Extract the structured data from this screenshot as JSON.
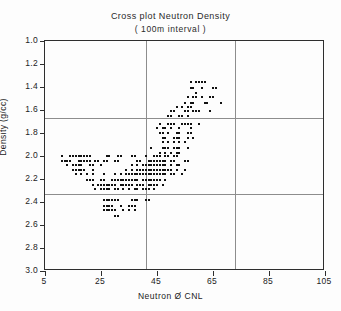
{
  "chart_data": {
    "type": "scatter",
    "title": "Cross plot Neutron Density",
    "subtitle": "( 100m interval )",
    "xlabel": "Neutron Ø CNL",
    "ylabel": "Density (g/cc)",
    "xlim": [
      5,
      105
    ],
    "ylim": [
      3.0,
      1.0
    ],
    "y_inverted": true,
    "xticks": [
      5,
      25,
      45,
      65,
      85,
      105
    ],
    "yticks": [
      1.0,
      1.2,
      1.4,
      1.6,
      1.8,
      2.0,
      2.2,
      2.4,
      2.6,
      2.8,
      3.0
    ],
    "xtick_labels": [
      "5",
      "25",
      "45",
      "65",
      "85",
      "105"
    ],
    "ytick_labels": [
      "1.0",
      "1.2",
      "1.4",
      "1.6",
      "1.8",
      "2.0",
      "2.2",
      "2.4",
      "2.6",
      "2.8",
      "3.0"
    ],
    "grid": true,
    "gridlines_h": [
      1.67,
      2.33
    ],
    "gridlines_v": [
      41,
      73
    ],
    "legend": null,
    "marker": "square",
    "marker_color": "#111111",
    "marker_size_px": 2,
    "series": [
      {
        "name": "Neutron-Density points",
        "points": [
          [
            57,
            1.36
          ],
          [
            59,
            1.36
          ],
          [
            60,
            1.36
          ],
          [
            61,
            1.36
          ],
          [
            62,
            1.36
          ],
          [
            57,
            1.41
          ],
          [
            58,
            1.41
          ],
          [
            61,
            1.41
          ],
          [
            65,
            1.41
          ],
          [
            66,
            1.41
          ],
          [
            59,
            1.45
          ],
          [
            56,
            1.49
          ],
          [
            58,
            1.49
          ],
          [
            59,
            1.49
          ],
          [
            61,
            1.49
          ],
          [
            64,
            1.49
          ],
          [
            65,
            1.49
          ],
          [
            55,
            1.54
          ],
          [
            57,
            1.54
          ],
          [
            58,
            1.54
          ],
          [
            62,
            1.54
          ],
          [
            63,
            1.54
          ],
          [
            68,
            1.54
          ],
          [
            52,
            1.57
          ],
          [
            54,
            1.57
          ],
          [
            56,
            1.57
          ],
          [
            57,
            1.57
          ],
          [
            50,
            1.61
          ],
          [
            51,
            1.61
          ],
          [
            55,
            1.61
          ],
          [
            56,
            1.61
          ],
          [
            58,
            1.61
          ],
          [
            59,
            1.61
          ],
          [
            60,
            1.61
          ],
          [
            64,
            1.61
          ],
          [
            49,
            1.65
          ],
          [
            50,
            1.65
          ],
          [
            53,
            1.65
          ],
          [
            54,
            1.65
          ],
          [
            56,
            1.65
          ],
          [
            46,
            1.72
          ],
          [
            49,
            1.72
          ],
          [
            50,
            1.72
          ],
          [
            51,
            1.72
          ],
          [
            54,
            1.72
          ],
          [
            55,
            1.72
          ],
          [
            56,
            1.72
          ],
          [
            57,
            1.72
          ],
          [
            60,
            1.72
          ],
          [
            45,
            1.76
          ],
          [
            47,
            1.76
          ],
          [
            48,
            1.76
          ],
          [
            50,
            1.76
          ],
          [
            53,
            1.76
          ],
          [
            57,
            1.76
          ],
          [
            46,
            1.8
          ],
          [
            47,
            1.8
          ],
          [
            49,
            1.8
          ],
          [
            52,
            1.8
          ],
          [
            53,
            1.8
          ],
          [
            56,
            1.8
          ],
          [
            57,
            1.8
          ],
          [
            47,
            1.84
          ],
          [
            48,
            1.84
          ],
          [
            51,
            1.84
          ],
          [
            52,
            1.84
          ],
          [
            53,
            1.84
          ],
          [
            56,
            1.84
          ],
          [
            58,
            1.84
          ],
          [
            47,
            1.88
          ],
          [
            49,
            1.88
          ],
          [
            51,
            1.88
          ],
          [
            53,
            1.88
          ],
          [
            55,
            1.88
          ],
          [
            43,
            1.93
          ],
          [
            47,
            1.93
          ],
          [
            48,
            1.93
          ],
          [
            49,
            1.93
          ],
          [
            51,
            1.93
          ],
          [
            52,
            1.93
          ],
          [
            53,
            1.93
          ],
          [
            56,
            1.93
          ],
          [
            46,
            1.97
          ],
          [
            48,
            1.97
          ],
          [
            50,
            1.97
          ],
          [
            52,
            1.97
          ],
          [
            53,
            1.97
          ],
          [
            11,
            2.0
          ],
          [
            14,
            2.0
          ],
          [
            15,
            2.0
          ],
          [
            16,
            2.0
          ],
          [
            17,
            2.0
          ],
          [
            18,
            2.0
          ],
          [
            19,
            2.0
          ],
          [
            20,
            2.0
          ],
          [
            21,
            2.0
          ],
          [
            27,
            2.0
          ],
          [
            28,
            2.0
          ],
          [
            31,
            2.0
          ],
          [
            32,
            2.0
          ],
          [
            36,
            2.0
          ],
          [
            37,
            2.0
          ],
          [
            41,
            2.0
          ],
          [
            44,
            2.0
          ],
          [
            45,
            2.0
          ],
          [
            46,
            2.0
          ],
          [
            48,
            2.0
          ],
          [
            49,
            2.0
          ],
          [
            51,
            2.0
          ],
          [
            52,
            2.0
          ],
          [
            11,
            2.04
          ],
          [
            12,
            2.04
          ],
          [
            13,
            2.04
          ],
          [
            14,
            2.04
          ],
          [
            17,
            2.04
          ],
          [
            18,
            2.04
          ],
          [
            19,
            2.04
          ],
          [
            20,
            2.04
          ],
          [
            21,
            2.04
          ],
          [
            23,
            2.04
          ],
          [
            24,
            2.04
          ],
          [
            26,
            2.04
          ],
          [
            27,
            2.04
          ],
          [
            30,
            2.04
          ],
          [
            31,
            2.04
          ],
          [
            38,
            2.04
          ],
          [
            39,
            2.04
          ],
          [
            42,
            2.04
          ],
          [
            43,
            2.04
          ],
          [
            44,
            2.04
          ],
          [
            45,
            2.04
          ],
          [
            46,
            2.04
          ],
          [
            47,
            2.04
          ],
          [
            48,
            2.04
          ],
          [
            50,
            2.04
          ],
          [
            51,
            2.04
          ],
          [
            55,
            2.04
          ],
          [
            56,
            2.04
          ],
          [
            13,
            2.08
          ],
          [
            15,
            2.08
          ],
          [
            16,
            2.08
          ],
          [
            17,
            2.08
          ],
          [
            18,
            2.08
          ],
          [
            21,
            2.08
          ],
          [
            22,
            2.08
          ],
          [
            25,
            2.08
          ],
          [
            36,
            2.08
          ],
          [
            38,
            2.08
          ],
          [
            40,
            2.08
          ],
          [
            41,
            2.08
          ],
          [
            42,
            2.08
          ],
          [
            43,
            2.08
          ],
          [
            44,
            2.08
          ],
          [
            45,
            2.08
          ],
          [
            46,
            2.08
          ],
          [
            47,
            2.08
          ],
          [
            48,
            2.08
          ],
          [
            50,
            2.08
          ],
          [
            52,
            2.08
          ],
          [
            53,
            2.08
          ],
          [
            15,
            2.12
          ],
          [
            16,
            2.12
          ],
          [
            17,
            2.12
          ],
          [
            18,
            2.12
          ],
          [
            19,
            2.12
          ],
          [
            22,
            2.12
          ],
          [
            34,
            2.12
          ],
          [
            36,
            2.12
          ],
          [
            38,
            2.12
          ],
          [
            39,
            2.12
          ],
          [
            40,
            2.12
          ],
          [
            41,
            2.12
          ],
          [
            42,
            2.12
          ],
          [
            43,
            2.12
          ],
          [
            44,
            2.12
          ],
          [
            45,
            2.12
          ],
          [
            46,
            2.12
          ],
          [
            47,
            2.12
          ],
          [
            48,
            2.12
          ],
          [
            49,
            2.12
          ],
          [
            50,
            2.12
          ],
          [
            52,
            2.12
          ],
          [
            55,
            2.12
          ],
          [
            16,
            2.16
          ],
          [
            18,
            2.16
          ],
          [
            20,
            2.16
          ],
          [
            22,
            2.16
          ],
          [
            26,
            2.16
          ],
          [
            30,
            2.16
          ],
          [
            32,
            2.16
          ],
          [
            34,
            2.16
          ],
          [
            35,
            2.16
          ],
          [
            36,
            2.16
          ],
          [
            37,
            2.16
          ],
          [
            38,
            2.16
          ],
          [
            39,
            2.16
          ],
          [
            40,
            2.16
          ],
          [
            41,
            2.16
          ],
          [
            42,
            2.16
          ],
          [
            43,
            2.16
          ],
          [
            44,
            2.16
          ],
          [
            45,
            2.16
          ],
          [
            46,
            2.16
          ],
          [
            47,
            2.16
          ],
          [
            48,
            2.16
          ],
          [
            50,
            2.16
          ],
          [
            51,
            2.16
          ],
          [
            54,
            2.16
          ],
          [
            20,
            2.21
          ],
          [
            21,
            2.21
          ],
          [
            22,
            2.21
          ],
          [
            25,
            2.21
          ],
          [
            26,
            2.21
          ],
          [
            29,
            2.21
          ],
          [
            30,
            2.21
          ],
          [
            31,
            2.21
          ],
          [
            32,
            2.21
          ],
          [
            33,
            2.21
          ],
          [
            34,
            2.21
          ],
          [
            35,
            2.21
          ],
          [
            36,
            2.21
          ],
          [
            37,
            2.21
          ],
          [
            38,
            2.21
          ],
          [
            40,
            2.21
          ],
          [
            41,
            2.21
          ],
          [
            42,
            2.21
          ],
          [
            43,
            2.21
          ],
          [
            44,
            2.21
          ],
          [
            45,
            2.21
          ],
          [
            46,
            2.21
          ],
          [
            48,
            2.21
          ],
          [
            22,
            2.25
          ],
          [
            24,
            2.25
          ],
          [
            25,
            2.25
          ],
          [
            26,
            2.25
          ],
          [
            27,
            2.25
          ],
          [
            28,
            2.25
          ],
          [
            29,
            2.25
          ],
          [
            30,
            2.25
          ],
          [
            32,
            2.25
          ],
          [
            33,
            2.25
          ],
          [
            34,
            2.25
          ],
          [
            35,
            2.25
          ],
          [
            36,
            2.25
          ],
          [
            38,
            2.25
          ],
          [
            39,
            2.25
          ],
          [
            40,
            2.25
          ],
          [
            42,
            2.25
          ],
          [
            43,
            2.25
          ],
          [
            44,
            2.25
          ],
          [
            45,
            2.25
          ],
          [
            47,
            2.25
          ],
          [
            23,
            2.29
          ],
          [
            25,
            2.29
          ],
          [
            26,
            2.29
          ],
          [
            27,
            2.29
          ],
          [
            28,
            2.29
          ],
          [
            30,
            2.29
          ],
          [
            31,
            2.29
          ],
          [
            33,
            2.29
          ],
          [
            35,
            2.29
          ],
          [
            37,
            2.29
          ],
          [
            38,
            2.29
          ],
          [
            40,
            2.29
          ],
          [
            41,
            2.29
          ],
          [
            42,
            2.29
          ],
          [
            44,
            2.29
          ],
          [
            26,
            2.38
          ],
          [
            27,
            2.38
          ],
          [
            28,
            2.38
          ],
          [
            29,
            2.38
          ],
          [
            30,
            2.38
          ],
          [
            31,
            2.38
          ],
          [
            36,
            2.38
          ],
          [
            37,
            2.38
          ],
          [
            38,
            2.38
          ],
          [
            41,
            2.38
          ],
          [
            42,
            2.38
          ],
          [
            26,
            2.43
          ],
          [
            27,
            2.43
          ],
          [
            28,
            2.43
          ],
          [
            29,
            2.43
          ],
          [
            32,
            2.43
          ],
          [
            35,
            2.43
          ],
          [
            36,
            2.43
          ],
          [
            37,
            2.43
          ],
          [
            26,
            2.47
          ],
          [
            27,
            2.47
          ],
          [
            28,
            2.47
          ],
          [
            29,
            2.47
          ],
          [
            30,
            2.47
          ],
          [
            33,
            2.47
          ],
          [
            35,
            2.47
          ],
          [
            37,
            2.47
          ],
          [
            30,
            2.52
          ],
          [
            31,
            2.52
          ]
        ]
      }
    ]
  }
}
